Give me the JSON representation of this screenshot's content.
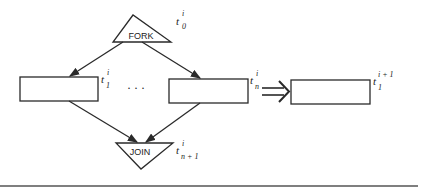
{
  "diagram": {
    "nodes": {
      "fork": {
        "label": "FORK",
        "time": {
          "base": "t",
          "sup": "i",
          "sub": "0"
        }
      },
      "join": {
        "label": "JOIN",
        "time": {
          "base": "t",
          "sup": "i",
          "sub": "n + 1"
        }
      },
      "task_first": {
        "label": "",
        "time": {
          "base": "t",
          "sup": "i",
          "sub": "1"
        }
      },
      "task_last": {
        "label": "",
        "time": {
          "base": "t",
          "sup": "i",
          "sub": "n"
        }
      },
      "task_next": {
        "label": "",
        "time": {
          "base": "t",
          "sup": "i + 1",
          "sub": "1"
        }
      }
    },
    "ellipsis": "· · ·",
    "transform_arrow": "⇒",
    "colors": {
      "stroke": "#2a2a2a",
      "background": "#ffffff",
      "rule": "#555555"
    }
  }
}
